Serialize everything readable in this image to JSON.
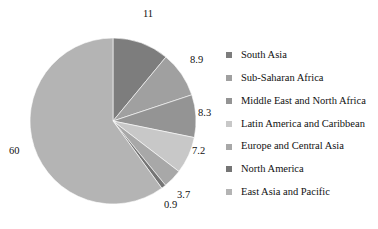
{
  "chart_data": {
    "type": "pie",
    "title": "",
    "labels": [
      "South Asia",
      "Sub-Saharan Africa",
      "Middle East and North Africa",
      "Latin America and Caribbean",
      "Europe and Central Asia",
      "North America",
      "East Asia and Pacific"
    ],
    "values": [
      11,
      8.9,
      8.3,
      7.2,
      3.7,
      0.9,
      60
    ],
    "value_labels": [
      "11",
      "8.9",
      "8.3",
      "7.2",
      "3.7",
      "0.9",
      "60"
    ],
    "colors": [
      "#7d7d7d",
      "#a0a0a0",
      "#949494",
      "#c8c8c8",
      "#a8a8a8",
      "#757575",
      "#b4b4b4"
    ],
    "start_angle_deg": 0,
    "direction": "clockwise",
    "legend_position": "right",
    "grid": false,
    "xlabel": "",
    "ylabel": ""
  },
  "legend": {
    "items": [
      {
        "label": "South Asia",
        "color": "#7d7d7d"
      },
      {
        "label": "Sub-Saharan Africa",
        "color": "#a0a0a0"
      },
      {
        "label": "Middle East and North Africa",
        "color": "#949494"
      },
      {
        "label": "Latin America and Caribbean",
        "color": "#c8c8c8"
      },
      {
        "label": "Europe and Central Asia",
        "color": "#a8a8a8"
      },
      {
        "label": "North America",
        "color": "#757575"
      },
      {
        "label": "East Asia and Pacific",
        "color": "#b4b4b4"
      }
    ]
  },
  "callouts": [
    {
      "text": "11",
      "x": 143,
      "y": 9
    },
    {
      "text": "8.9",
      "x": 190,
      "y": 55
    },
    {
      "text": "8.3",
      "x": 198,
      "y": 108
    },
    {
      "text": "7.2",
      "x": 192,
      "y": 146
    },
    {
      "text": "3.7",
      "x": 177,
      "y": 190
    },
    {
      "text": "0.9",
      "x": 164,
      "y": 200
    },
    {
      "text": "60",
      "x": 9,
      "y": 146
    }
  ],
  "geometry": {
    "center_x": 113,
    "center_y": 121,
    "radius": 83
  }
}
